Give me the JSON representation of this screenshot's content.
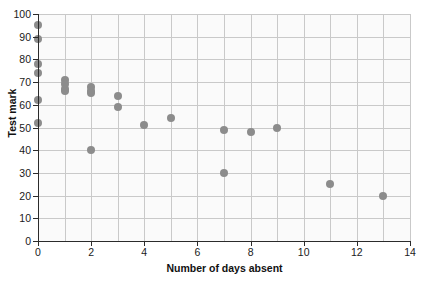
{
  "chart_data": {
    "type": "scatter",
    "title": "",
    "xlabel": "Number of days absent",
    "ylabel": "Test mark",
    "xlim": [
      0,
      14
    ],
    "ylim": [
      0,
      100
    ],
    "xticks": [
      0,
      2,
      4,
      6,
      8,
      10,
      12,
      14
    ],
    "xticklabels": [
      "0",
      "2",
      "4",
      "6",
      "8",
      "10",
      "12",
      "14"
    ],
    "yticks": [
      0,
      10,
      20,
      30,
      40,
      50,
      60,
      70,
      80,
      90,
      100
    ],
    "yticklabels": [
      "0",
      "10",
      "20",
      "30",
      "40",
      "50",
      "60",
      "70",
      "80",
      "90",
      "100"
    ],
    "grid": true,
    "grid_x_minor_step": 1,
    "legend": "none",
    "marker_color": "#8c8c8c",
    "marker_size": 8,
    "plot_background": "#fafafa",
    "gridline_color": "#c9c9c9",
    "axis_color": "#2b2b2b",
    "points": [
      {
        "x": 0,
        "y": 95
      },
      {
        "x": 0,
        "y": 89
      },
      {
        "x": 0,
        "y": 78
      },
      {
        "x": 0,
        "y": 74
      },
      {
        "x": 0,
        "y": 62
      },
      {
        "x": 0,
        "y": 52
      },
      {
        "x": 1,
        "y": 71
      },
      {
        "x": 1,
        "y": 69
      },
      {
        "x": 1,
        "y": 67
      },
      {
        "x": 1,
        "y": 66
      },
      {
        "x": 2,
        "y": 68
      },
      {
        "x": 2,
        "y": 66
      },
      {
        "x": 2,
        "y": 65
      },
      {
        "x": 2,
        "y": 40
      },
      {
        "x": 3,
        "y": 64
      },
      {
        "x": 3,
        "y": 59
      },
      {
        "x": 4,
        "y": 51
      },
      {
        "x": 5,
        "y": 54
      },
      {
        "x": 7,
        "y": 49
      },
      {
        "x": 7,
        "y": 30
      },
      {
        "x": 8,
        "y": 48
      },
      {
        "x": 9,
        "y": 50
      },
      {
        "x": 11,
        "y": 25
      },
      {
        "x": 13,
        "y": 20
      }
    ]
  }
}
